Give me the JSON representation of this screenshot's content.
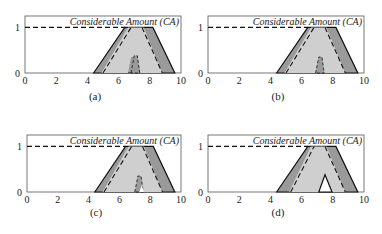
{
  "figure": {
    "captions": [
      "(a)",
      "(b)",
      "(c)",
      "(d)"
    ]
  },
  "colors": {
    "outer_fill": "#9a9a9a",
    "inner_fill": "#cfcfcf",
    "notch_fill": "#9a9a9a",
    "hole_fill": "#ffffff",
    "line": "#111111"
  },
  "chart_data": [
    {
      "type": "area",
      "caption": "(a)",
      "title": "Considerable Amount (CA)",
      "xlim": [
        0,
        10
      ],
      "ylim": [
        0,
        1.25
      ],
      "xticks": [
        "0",
        "2",
        "4",
        "6",
        "8",
        "10"
      ],
      "yticks": [
        "0",
        "1"
      ],
      "reference_line": {
        "y": 1,
        "x_from": 0,
        "x_to": 6.4,
        "style": "dashed"
      },
      "outer_trapezoid": [
        [
          4.4,
          0
        ],
        [
          6.4,
          1
        ],
        [
          8.2,
          1
        ],
        [
          9.6,
          0
        ]
      ],
      "inner_shape": [
        [
          4.9,
          0
        ],
        [
          6.6,
          1
        ],
        [
          7.6,
          1
        ],
        [
          8.8,
          0
        ],
        [
          7.4,
          0
        ],
        [
          7.2,
          0.35
        ],
        [
          6.8,
          0.35
        ],
        [
          6.6,
          0
        ]
      ],
      "inner_dashed": [
        [
          5.0,
          0
        ],
        [
          6.8,
          1
        ]
      ],
      "inner_dashed_right": [
        [
          7.5,
          1
        ],
        [
          8.8,
          0
        ]
      ],
      "notch": {
        "kind": "bump",
        "points": [
          [
            6.8,
            0
          ],
          [
            7.0,
            0.38
          ],
          [
            7.2,
            0.38
          ],
          [
            7.35,
            0
          ]
        ]
      }
    },
    {
      "type": "area",
      "caption": "(b)",
      "title": "Considerable Amount (CA)",
      "xlim": [
        0,
        10
      ],
      "ylim": [
        0,
        1.25
      ],
      "xticks": [
        "0",
        "2",
        "4",
        "6",
        "8",
        "10"
      ],
      "yticks": [
        "0",
        "1"
      ],
      "reference_line": {
        "y": 1,
        "x_from": 0,
        "x_to": 6.4,
        "style": "dashed"
      },
      "outer_trapezoid": [
        [
          4.4,
          0
        ],
        [
          6.4,
          1
        ],
        [
          8.2,
          1
        ],
        [
          9.6,
          0
        ]
      ],
      "inner_shape": [
        [
          4.9,
          0
        ],
        [
          6.6,
          1
        ],
        [
          7.6,
          1
        ],
        [
          8.8,
          0
        ]
      ],
      "inner_dashed": [
        [
          5.0,
          0
        ],
        [
          6.8,
          1
        ]
      ],
      "inner_dashed_right": [
        [
          7.5,
          1
        ],
        [
          8.8,
          0
        ]
      ],
      "notch": {
        "kind": "bump",
        "points": [
          [
            6.9,
            0
          ],
          [
            7.1,
            0.35
          ],
          [
            7.3,
            0.35
          ],
          [
            7.45,
            0
          ]
        ]
      }
    },
    {
      "type": "area",
      "caption": "(c)",
      "title": "Considerable Amount (CA)",
      "xlim": [
        0,
        10
      ],
      "ylim": [
        0,
        1.25
      ],
      "xticks": [
        "0",
        "2",
        "4",
        "6",
        "8",
        "10"
      ],
      "yticks": [
        "0",
        "1"
      ],
      "reference_line": {
        "y": 1,
        "x_from": 0,
        "x_to": 6.4,
        "style": "dashed"
      },
      "outer_trapezoid": [
        [
          4.4,
          0
        ],
        [
          6.4,
          1
        ],
        [
          8.2,
          1
        ],
        [
          9.6,
          0
        ]
      ],
      "inner_shape": [
        [
          4.9,
          0
        ],
        [
          6.6,
          1
        ],
        [
          7.6,
          1
        ],
        [
          8.8,
          0
        ]
      ],
      "inner_dashed": [
        [
          5.0,
          0
        ],
        [
          6.8,
          1
        ]
      ],
      "inner_dashed_right": [
        [
          7.5,
          1
        ],
        [
          8.8,
          0
        ]
      ],
      "notch": {
        "kind": "bump-with-hole",
        "points": [
          [
            7.0,
            0
          ],
          [
            7.2,
            0.35
          ],
          [
            7.4,
            0.35
          ],
          [
            7.55,
            0
          ]
        ],
        "hole": [
          [
            7.3,
            0
          ],
          [
            7.45,
            0.15
          ],
          [
            7.6,
            0
          ]
        ]
      }
    },
    {
      "type": "area",
      "caption": "(d)",
      "title": "Considerable Amount (CA)",
      "xlim": [
        0,
        10
      ],
      "ylim": [
        0,
        1.25
      ],
      "xticks": [
        "0",
        "2",
        "4",
        "6",
        "8",
        "10"
      ],
      "yticks": [
        "0",
        "1"
      ],
      "reference_line": {
        "y": 1,
        "x_from": 0,
        "x_to": 6.4,
        "style": "dashed"
      },
      "outer_trapezoid": [
        [
          4.4,
          0
        ],
        [
          6.4,
          1
        ],
        [
          8.2,
          1
        ],
        [
          9.6,
          0
        ]
      ],
      "inner_shape": [
        [
          5.2,
          0
        ],
        [
          6.6,
          1
        ],
        [
          7.6,
          1
        ],
        [
          8.8,
          0
        ]
      ],
      "inner_dashed": [
        [
          5.3,
          0
        ],
        [
          6.8,
          1
        ]
      ],
      "inner_dashed_right": [
        [
          7.5,
          1
        ],
        [
          8.8,
          0
        ]
      ],
      "notch": {
        "kind": "hole",
        "points": [
          [
            7.1,
            0
          ],
          [
            7.5,
            0.38
          ],
          [
            7.95,
            0
          ]
        ]
      }
    }
  ]
}
